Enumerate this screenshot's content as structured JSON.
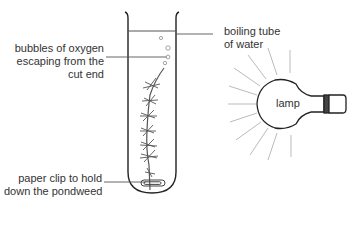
{
  "diagram": {
    "type": "experiment-setup",
    "labels": {
      "bubbles": [
        "bubbles of oxygen",
        "escaping from the",
        "cut end"
      ],
      "tube": [
        "boiling tube",
        "of water"
      ],
      "clip": [
        "paper clip to hold",
        "down the pondweed"
      ],
      "lamp": "lamp"
    },
    "colors": {
      "line": "#222222",
      "ray": "#bbbbbb",
      "text": "#333333",
      "plant": "#555555"
    }
  }
}
